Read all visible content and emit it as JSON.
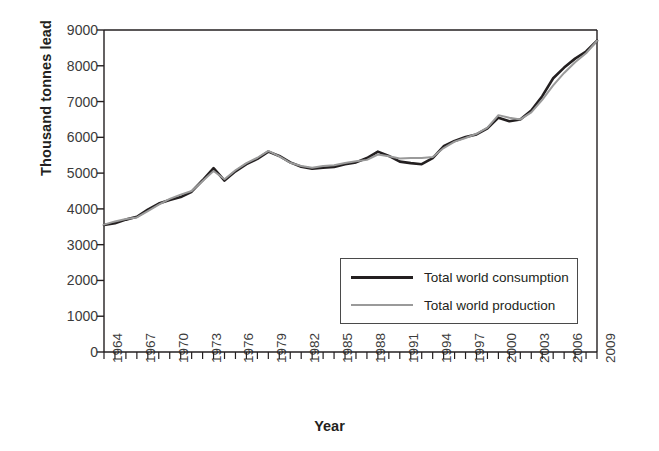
{
  "chart_data": {
    "type": "line",
    "title": "",
    "xlabel": "Year",
    "ylabel": "Thousand tonnes lead",
    "xlim": [
      1964,
      2009
    ],
    "ylim": [
      0,
      9000
    ],
    "grid": false,
    "legend_position": "inside-bottom-right",
    "y_ticks": [
      9000,
      8000,
      7000,
      6000,
      5000,
      4000,
      3000,
      2000,
      1000,
      0
    ],
    "y_tick_labels": [
      "9000",
      "8000",
      "7000",
      "6000",
      "5000",
      "4000",
      "3000",
      "2000",
      "1000",
      "0"
    ],
    "x_tick_labels": [
      "1964",
      "1967",
      "1970",
      "1973",
      "1976",
      "1979",
      "1982",
      "1985",
      "1988",
      "1991",
      "1994",
      "1997",
      "2000",
      "2003",
      "2006",
      "2009"
    ],
    "x_tick_label_years": [
      1964,
      1967,
      1970,
      1973,
      1976,
      1979,
      1982,
      1985,
      1988,
      1991,
      1994,
      1997,
      2000,
      2003,
      2006,
      2009
    ],
    "x_minor_tick_interval": 1,
    "x": [
      1964,
      1965,
      1966,
      1967,
      1968,
      1969,
      1970,
      1971,
      1972,
      1973,
      1974,
      1975,
      1976,
      1977,
      1978,
      1979,
      1980,
      1981,
      1982,
      1983,
      1984,
      1985,
      1986,
      1987,
      1988,
      1989,
      1990,
      1991,
      1992,
      1993,
      1994,
      1995,
      1996,
      1997,
      1998,
      1999,
      2000,
      2001,
      2002,
      2003,
      2004,
      2005,
      2006,
      2007,
      2008,
      2009
    ],
    "series": [
      {
        "name": "Total world consumption",
        "color": "#231f20",
        "width": 2.6,
        "values": [
          3550,
          3600,
          3700,
          3780,
          3980,
          4150,
          4250,
          4330,
          4480,
          4800,
          5140,
          4790,
          5050,
          5250,
          5400,
          5600,
          5480,
          5300,
          5180,
          5120,
          5150,
          5170,
          5250,
          5300,
          5420,
          5600,
          5480,
          5320,
          5280,
          5250,
          5420,
          5750,
          5900,
          6010,
          6080,
          6250,
          6550,
          6450,
          6500,
          6750,
          7150,
          7650,
          7950,
          8200,
          8400,
          8700
        ]
      },
      {
        "name": "Total world production",
        "color": "#9a9a9a",
        "width": 2.0,
        "values": [
          3560,
          3650,
          3720,
          3760,
          3940,
          4120,
          4280,
          4400,
          4500,
          4780,
          5060,
          4830,
          5080,
          5280,
          5430,
          5620,
          5470,
          5290,
          5200,
          5150,
          5200,
          5220,
          5280,
          5330,
          5370,
          5520,
          5470,
          5410,
          5420,
          5420,
          5450,
          5700,
          5880,
          5980,
          6100,
          6270,
          6620,
          6550,
          6500,
          6700,
          7050,
          7450,
          7800,
          8100,
          8350,
          8700
        ]
      }
    ]
  },
  "legend": {
    "items": [
      {
        "label": "Total world consumption"
      },
      {
        "label": "Total world production"
      }
    ]
  },
  "axes": {
    "y_axis_title": "Thousand tonnes lead",
    "x_axis_title": "Year"
  }
}
